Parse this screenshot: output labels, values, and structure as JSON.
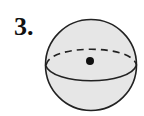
{
  "problem": {
    "number_label": "3."
  },
  "figure": {
    "type": "sphere",
    "fill_color": "#e6e6e6",
    "stroke_color": "#222222",
    "center_marker": "point-dot",
    "equator_back": "dashed-arc",
    "equator_front": "solid-arc"
  }
}
